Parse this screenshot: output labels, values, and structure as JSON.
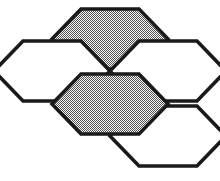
{
  "figure": {
    "name": "hexagon-cluster",
    "background_color": "#ffffff",
    "outline_color": "#1a1a1a",
    "outline_width_px": 3.6,
    "gray_fill_color": "#a9a9a9",
    "white_fill_color": "#ffffff",
    "gray_fill_style": "dither-checker",
    "canvas": {
      "width": 220,
      "height": 181
    },
    "hex_geometry": {
      "orientation": "flat-top",
      "width_px": 116,
      "height_px": 100,
      "count": 5,
      "gray_count": 2,
      "white_count": 3
    },
    "cells": [
      {
        "id": "hex-top-center",
        "label": "Top Center",
        "fill": "gray",
        "cx": 110,
        "cy": 39,
        "points": "81,9 139,9 168,39 139,69 81,69 52,39"
      },
      {
        "id": "hex-left",
        "label": "Left",
        "fill": "white",
        "cx": 52,
        "cy": 71,
        "points": "23,41 81,41 110,71 81,101 23,101 -6,71"
      },
      {
        "id": "hex-right",
        "label": "Right",
        "fill": "white",
        "cx": 168,
        "cy": 71,
        "points": "139,41 197,41 226,71 197,101 139,101 110,71"
      },
      {
        "id": "hex-center",
        "label": "Center",
        "fill": "gray",
        "cx": 110,
        "cy": 104,
        "points": "81,74 139,74 168,104 139,134 81,134 52,104"
      },
      {
        "id": "hex-bottom-right",
        "label": "Bottom Right",
        "fill": "white",
        "cx": 168,
        "cy": 136,
        "points": "139,106 197,106 226,136 197,166 139,166 110,136"
      }
    ]
  }
}
